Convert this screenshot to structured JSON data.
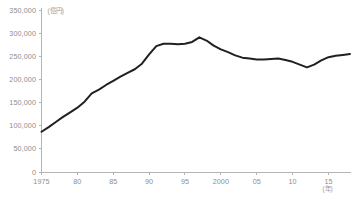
{
  "chart_data": {
    "type": "line",
    "title": "",
    "subtitle": "",
    "xlabel": "(年)",
    "ylabel": "(億円)",
    "unit_label_y": "(億円)",
    "unit_label_x": "(年)",
    "xlim": [
      1975,
      2018
    ],
    "ylim": [
      0,
      350000
    ],
    "grid": false,
    "legend": "none",
    "line_color": "#221f1f",
    "axis_color": "#b4b4b4",
    "tick_label_color": "#8d8d8d",
    "y_ticks": [
      0,
      50000,
      100000,
      150000,
      200000,
      250000,
      300000,
      350000
    ],
    "y_tick_labels": [
      "0",
      "50,000",
      "100,000",
      "150,000",
      "200,000",
      "250,000",
      "300,000",
      "350,000"
    ],
    "x_ticks": [
      1975,
      1980,
      1985,
      1990,
      1995,
      2000,
      2005,
      2010,
      2015
    ],
    "x_tick_labels": [
      "1975",
      "80",
      "85",
      "90",
      "95",
      "2000",
      "05",
      "10",
      "15"
    ],
    "x": [
      1975,
      1976,
      1977,
      1978,
      1979,
      1980,
      1981,
      1982,
      1983,
      1984,
      1985,
      1986,
      1987,
      1988,
      1989,
      1990,
      1991,
      1992,
      1993,
      1994,
      1995,
      1996,
      1997,
      1998,
      1999,
      2000,
      2001,
      2002,
      2003,
      2004,
      2005,
      2006,
      2007,
      2008,
      2009,
      2010,
      2011,
      2012,
      2013,
      2014,
      2015,
      2016,
      2017,
      2018
    ],
    "values": [
      87000,
      97000,
      108000,
      119000,
      129000,
      139000,
      152000,
      170000,
      178000,
      188000,
      197000,
      206000,
      214000,
      222000,
      234000,
      254000,
      272000,
      277000,
      277000,
      276000,
      277000,
      281000,
      291000,
      284000,
      273000,
      265000,
      259000,
      252000,
      247000,
      245000,
      243000,
      243000,
      244000,
      245000,
      242000,
      238000,
      232000,
      226000,
      232000,
      241000,
      248000,
      251000,
      253000,
      255000
    ],
    "series": [
      {
        "name": "",
        "values": [
          87000,
          97000,
          108000,
          119000,
          129000,
          139000,
          152000,
          170000,
          178000,
          188000,
          197000,
          206000,
          214000,
          222000,
          234000,
          254000,
          272000,
          277000,
          277000,
          276000,
          277000,
          281000,
          291000,
          284000,
          273000,
          265000,
          259000,
          252000,
          247000,
          245000,
          243000,
          243000,
          244000,
          245000,
          242000,
          238000,
          232000,
          226000,
          232000,
          241000,
          248000,
          251000,
          253000,
          255000
        ]
      }
    ],
    "annotations": []
  }
}
